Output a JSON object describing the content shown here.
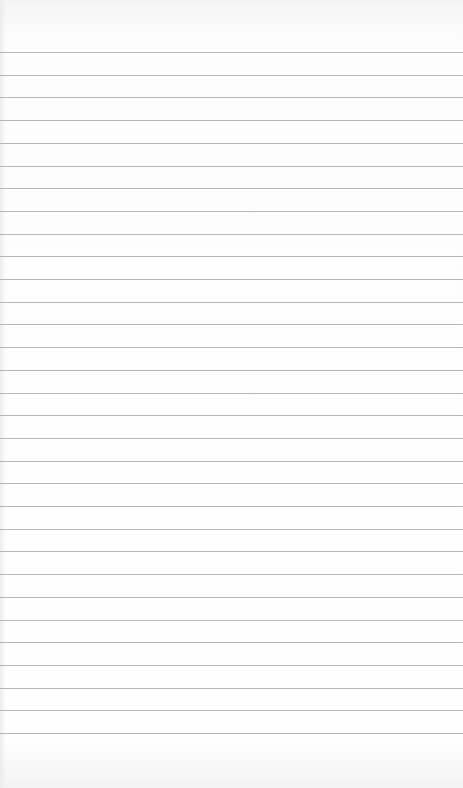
{
  "paper": {
    "background": "#fbfbfb",
    "line_color": "#a9a9a9",
    "first_line_y": 52,
    "line_spacing": 22.7,
    "line_count": 31
  }
}
